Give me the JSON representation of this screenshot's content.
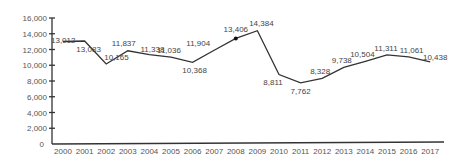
{
  "chart_data": {
    "type": "line",
    "title": "",
    "xlabel": "",
    "ylabel": "",
    "ylim": [
      0,
      16000
    ],
    "yticks": [
      0,
      2000,
      4000,
      6000,
      8000,
      10000,
      12000,
      14000,
      16000
    ],
    "ytick_labels": [
      "0",
      "2,000",
      "4,000",
      "6,000",
      "8,000",
      "10,000",
      "12,000",
      "14,000",
      "16,000"
    ],
    "grid": false,
    "legend": "none",
    "categories": [
      "2000",
      "2001",
      "2002",
      "2003",
      "2004",
      "2005",
      "2006",
      "2007",
      "2008",
      "2009",
      "2010",
      "2011",
      "2012",
      "2013",
      "2014",
      "2015",
      "2016",
      "2017"
    ],
    "series": [
      {
        "name": "value",
        "values": [
          13012,
          13083,
          10165,
          11837,
          11338,
          11036,
          10368,
          11904,
          13406,
          14384,
          8811,
          7762,
          8328,
          9738,
          10504,
          11311,
          11061,
          10438
        ],
        "labels": [
          "13,012",
          "13,083",
          "10,165",
          "11,837",
          "11,338",
          "11,036",
          "10,368",
          "11,904",
          "13,406",
          "14,384",
          "8,811",
          "7,762",
          "8,328",
          "9,738",
          "10,504",
          "11,311",
          "11,061",
          "10,438"
        ],
        "marker_at": "2008"
      }
    ]
  }
}
